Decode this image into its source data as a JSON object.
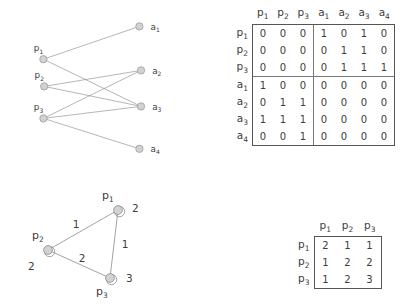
{
  "bipartite": {
    "left_nodes": [
      {
        "id": "p1",
        "label": "p",
        "sub": "1",
        "x": 28,
        "y": 74
      },
      {
        "id": "p2",
        "label": "p",
        "sub": "2",
        "x": 29,
        "y": 108
      },
      {
        "id": "p3",
        "label": "p",
        "sub": "3",
        "x": 28,
        "y": 148
      }
    ],
    "right_nodes": [
      {
        "id": "a1",
        "label": "a",
        "sub": "1",
        "x": 148,
        "y": 33
      },
      {
        "id": "a2",
        "label": "a",
        "sub": "2",
        "x": 150,
        "y": 88
      },
      {
        "id": "a3",
        "label": "a",
        "sub": "3",
        "x": 150,
        "y": 133
      },
      {
        "id": "a4",
        "label": "a",
        "sub": "4",
        "x": 148,
        "y": 186
      }
    ],
    "edges": [
      {
        "from": "p1",
        "to": "a1"
      },
      {
        "from": "p1",
        "to": "a3"
      },
      {
        "from": "p2",
        "to": "a2"
      },
      {
        "from": "p2",
        "to": "a3"
      },
      {
        "from": "p3",
        "to": "a2"
      },
      {
        "from": "p3",
        "to": "a3"
      },
      {
        "from": "p3",
        "to": "a4"
      }
    ]
  },
  "matrix_large": {
    "col_headers": [
      "p1",
      "p2",
      "p3",
      "a1",
      "a2",
      "a3",
      "a4"
    ],
    "col_header_text": [
      {
        "base": "p",
        "sub": "1"
      },
      {
        "base": "p",
        "sub": "2"
      },
      {
        "base": "p",
        "sub": "3"
      },
      {
        "base": "a",
        "sub": "1"
      },
      {
        "base": "a",
        "sub": "2"
      },
      {
        "base": "a",
        "sub": "3"
      },
      {
        "base": "a",
        "sub": "4"
      }
    ],
    "row_headers": [
      {
        "base": "p",
        "sub": "1"
      },
      {
        "base": "p",
        "sub": "2"
      },
      {
        "base": "p",
        "sub": "3"
      },
      {
        "base": "a",
        "sub": "1"
      },
      {
        "base": "a",
        "sub": "2"
      },
      {
        "base": "a",
        "sub": "3"
      },
      {
        "base": "a",
        "sub": "4"
      }
    ],
    "rows": [
      [
        0,
        0,
        0,
        1,
        0,
        1,
        0
      ],
      [
        0,
        0,
        0,
        0,
        1,
        1,
        0
      ],
      [
        0,
        0,
        0,
        0,
        1,
        1,
        1
      ],
      [
        1,
        0,
        0,
        0,
        0,
        0,
        0
      ],
      [
        0,
        1,
        1,
        0,
        0,
        0,
        0
      ],
      [
        1,
        1,
        1,
        0,
        0,
        0,
        0
      ],
      [
        0,
        0,
        1,
        0,
        0,
        0,
        0
      ]
    ],
    "block_divider_after_col": 3,
    "block_divider_after_row": 3
  },
  "matrix_small": {
    "col_header_text": [
      {
        "base": "p",
        "sub": "1"
      },
      {
        "base": "p",
        "sub": "2"
      },
      {
        "base": "p",
        "sub": "3"
      }
    ],
    "row_headers": [
      {
        "base": "p",
        "sub": "1"
      },
      {
        "base": "p",
        "sub": "2"
      },
      {
        "base": "p",
        "sub": "3"
      }
    ],
    "rows": [
      [
        2,
        1,
        1
      ],
      [
        1,
        2,
        2
      ],
      [
        1,
        2,
        3
      ]
    ]
  },
  "triangle": {
    "nodes": [
      {
        "id": "p1",
        "base": "p",
        "sub": "1",
        "x": 108,
        "y": 28,
        "label_x": 92,
        "label_y": 17,
        "loop_weight": "2",
        "loop_wx": 122,
        "loop_wy": 30
      },
      {
        "id": "p2",
        "base": "p",
        "sub": "2",
        "x": 38,
        "y": 68,
        "label_x": 22,
        "label_y": 57,
        "loop_weight": "2",
        "loop_wx": 18,
        "loop_wy": 88
      },
      {
        "id": "p3",
        "base": "p",
        "sub": "3",
        "x": 100,
        "y": 96,
        "label_x": 86,
        "label_y": 113,
        "loop_weight": "3",
        "loop_wx": 116,
        "loop_wy": 100
      }
    ],
    "edges": [
      {
        "from": "p1",
        "to": "p2",
        "weight": "1",
        "wx": 66,
        "wy": 46
      },
      {
        "from": "p1",
        "to": "p3",
        "weight": "1",
        "wx": 115,
        "wy": 66
      },
      {
        "from": "p2",
        "to": "p3",
        "weight": "2",
        "wx": 72,
        "wy": 80
      }
    ]
  },
  "colors": {
    "node_fill": "#d2d2d2",
    "node_stroke": "#8e8e8e",
    "edge": "#8c8c8c",
    "text": "#3c3c3c",
    "border": "#555555",
    "divider": "#777777"
  }
}
